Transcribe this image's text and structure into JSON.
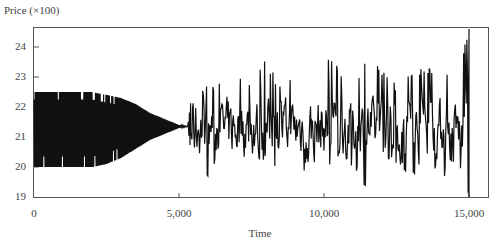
{
  "chart_data": {
    "type": "line",
    "title": "",
    "xlabel": "Time",
    "ylabel": "Price (×100)",
    "xlim": [
      0,
      15700
    ],
    "ylim": [
      19,
      24.6
    ],
    "x_ticks": [
      0,
      5000,
      10000,
      15000
    ],
    "x_tick_labels": [
      "0",
      "5,000",
      "10,000",
      "15,000"
    ],
    "y_ticks": [
      19,
      20,
      21,
      22,
      23,
      24
    ],
    "y_tick_labels": [
      "19",
      "20",
      "21",
      "22",
      "23",
      "24"
    ],
    "grid": false,
    "legend": null,
    "series": [
      {
        "name": "Price",
        "color": "#111111",
        "phases": [
          {
            "description": "regular oscillation",
            "x_range": [
              0,
              2200
            ],
            "low": 20.0,
            "high": 22.5
          },
          {
            "description": "damped oscillation converging",
            "x_range": [
              2200,
              5300
            ],
            "converges_to": 21.35
          },
          {
            "description": "irregular fluctuations",
            "x_range": [
              5400,
              15000
            ],
            "min": 19.3,
            "max": 24.1,
            "mean": 21.3
          },
          {
            "description": "final spike",
            "x": 15000,
            "low": 19.0,
            "high": 24.6
          }
        ],
        "sampled_values": {
          "x": [
            0,
            500,
            1000,
            1500,
            2000,
            2500,
            3000,
            3500,
            4000,
            4500,
            5000,
            5300,
            5500,
            6000,
            6500,
            7000,
            7500,
            8000,
            8500,
            9000,
            9500,
            10000,
            10500,
            11000,
            11500,
            12000,
            12500,
            13000,
            13500,
            14000,
            14500,
            15000
          ],
          "high": [
            22.5,
            22.5,
            22.5,
            22.5,
            22.5,
            22.4,
            22.3,
            22.1,
            21.8,
            21.6,
            21.4,
            21.35,
            22.9,
            22.7,
            22.8,
            23.0,
            22.9,
            23.6,
            22.7,
            23.1,
            22.5,
            23.9,
            23.4,
            22.7,
            23.8,
            23.3,
            22.8,
            23.2,
            23.3,
            23.5,
            23.0,
            24.6
          ],
          "low": [
            20.0,
            20.0,
            20.0,
            20.0,
            20.0,
            20.1,
            20.3,
            20.6,
            20.9,
            21.1,
            21.3,
            21.35,
            19.8,
            19.7,
            20.0,
            19.6,
            19.9,
            20.2,
            19.9,
            19.3,
            20.2,
            19.8,
            20.3,
            19.9,
            19.2,
            20.4,
            20.1,
            19.5,
            20.5,
            19.4,
            20.2,
            19.0
          ]
        }
      }
    ]
  }
}
